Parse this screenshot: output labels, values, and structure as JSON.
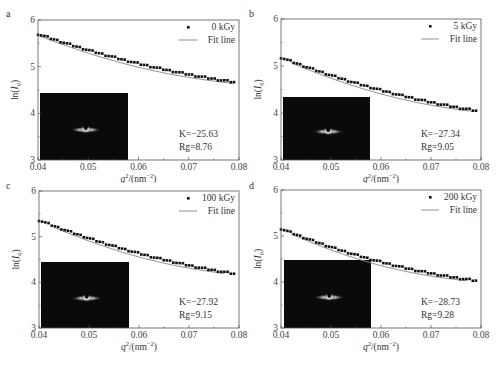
{
  "chart_data": [
    {
      "type": "scatter",
      "panel_label": "a",
      "title": "",
      "xlabel": "q²/(nm⁻²)",
      "ylabel": "ln(I_q)",
      "xlim": [
        0.04,
        0.08
      ],
      "ylim": [
        3,
        6
      ],
      "xticks": [
        "0.04",
        "0.05",
        "0.06",
        "0.07",
        "0.08"
      ],
      "yticks": [
        "3",
        "4",
        "5",
        "6"
      ],
      "grid": false,
      "legend": {
        "position": "upper right",
        "entries": [
          "0 kGy",
          "Fit line"
        ]
      },
      "series": [
        {
          "name": "0 kGy",
          "kind": "scatter",
          "x_start": 0.04,
          "x_end": 0.079,
          "y_start": 5.7,
          "y_mid": 5.08,
          "y_end": 4.67
        },
        {
          "name": "Fit line",
          "kind": "line",
          "x_start": 0.04,
          "x_end": 0.079,
          "y_start": 5.7,
          "y_end": 4.67
        }
      ],
      "annotations": [
        "K=−25.63",
        "Rg=8.76"
      ],
      "inset": "SAXS 2D scattering pattern"
    },
    {
      "type": "scatter",
      "panel_label": "b",
      "title": "",
      "xlabel": "q²/(nm⁻²)",
      "ylabel": "ln(I_q)",
      "xlim": [
        0.04,
        0.08
      ],
      "ylim": [
        3,
        6
      ],
      "xticks": [
        "0.04",
        "0.05",
        "0.06",
        "0.07",
        "0.08"
      ],
      "yticks": [
        "3",
        "4",
        "5",
        "6"
      ],
      "grid": false,
      "legend": {
        "position": "upper right",
        "entries": [
          "5 kGy",
          "Fit line"
        ]
      },
      "series": [
        {
          "name": "5 kGy",
          "kind": "scatter",
          "x_start": 0.04,
          "x_end": 0.079,
          "y_start": 5.18,
          "y_mid": 4.5,
          "y_end": 4.05
        },
        {
          "name": "Fit line",
          "kind": "line",
          "x_start": 0.042,
          "x_end": 0.078,
          "y_start": 5.02,
          "y_end": 4.0
        }
      ],
      "annotations": [
        "K=−27.34",
        "Rg=9.05"
      ],
      "inset": "SAXS 2D scattering pattern"
    },
    {
      "type": "scatter",
      "panel_label": "c",
      "title": "",
      "xlabel": "q²/(nm⁻²)",
      "ylabel": "ln(I_q)",
      "xlim": [
        0.04,
        0.08
      ],
      "ylim": [
        3,
        6
      ],
      "xticks": [
        "0.04",
        "0.05",
        "0.06",
        "0.07",
        "0.08"
      ],
      "yticks": [
        "3",
        "4",
        "5",
        "6"
      ],
      "grid": false,
      "legend": {
        "position": "upper right",
        "entries": [
          "100 kGy",
          "Fit line"
        ]
      },
      "series": [
        {
          "name": "100 kGy",
          "kind": "scatter",
          "x_start": 0.04,
          "x_end": 0.079,
          "y_start": 5.36,
          "y_mid": 4.65,
          "y_end": 4.19
        },
        {
          "name": "Fit line",
          "kind": "line",
          "x_start": 0.043,
          "x_end": 0.077,
          "y_start": 5.15,
          "y_end": 4.21
        }
      ],
      "annotations": [
        "K=−27.92",
        "Rg=9.15"
      ],
      "inset": "SAXS 2D scattering pattern"
    },
    {
      "type": "scatter",
      "panel_label": "d",
      "title": "",
      "xlabel": "q²/(nm⁻²)",
      "ylabel": "ln(I_q)",
      "xlim": [
        0.04,
        0.08
      ],
      "ylim": [
        3,
        6
      ],
      "xticks": [
        "0.04",
        "0.05",
        "0.06",
        "0.07",
        "0.08"
      ],
      "yticks": [
        "3",
        "4",
        "5",
        "6"
      ],
      "grid": false,
      "legend": {
        "position": "upper right",
        "entries": [
          "200 kGy",
          "Fit line"
        ]
      },
      "series": [
        {
          "name": "200 kGy",
          "kind": "scatter",
          "x_start": 0.04,
          "x_end": 0.079,
          "y_start": 5.16,
          "y_mid": 4.45,
          "y_end": 4.03
        },
        {
          "name": "Fit line",
          "kind": "line",
          "x_start": 0.042,
          "x_end": 0.077,
          "y_start": 5.05,
          "y_end": 4.02
        }
      ],
      "annotations": [
        "K=−28.73",
        "Rg=9.28"
      ],
      "inset": "SAXS 2D scattering pattern"
    }
  ],
  "panels": [
    {
      "label": "a",
      "legend_series": "0 kGy",
      "legend_fit": "Fit line",
      "k_text": "K=−25.63",
      "rg_text": "Rg=8.76"
    },
    {
      "label": "b",
      "legend_series": "5 kGy",
      "legend_fit": "Fit line",
      "k_text": "K=−27.34",
      "rg_text": "Rg=9.05"
    },
    {
      "label": "c",
      "legend_series": "100 kGy",
      "legend_fit": "Fit line",
      "k_text": "K=−27.92",
      "rg_text": "Rg=9.15"
    },
    {
      "label": "d",
      "legend_series": "200 kGy",
      "legend_fit": "Fit line",
      "k_text": "K=−28.73",
      "rg_text": "Rg=9.28"
    }
  ],
  "axes": {
    "xticks": [
      "0.04",
      "0.05",
      "0.06",
      "0.07",
      "0.08"
    ],
    "yticks": [
      "3",
      "4",
      "5",
      "6"
    ],
    "xlabel_main": "q",
    "xlabel_sup": "2",
    "xlabel_rest": "/(nm",
    "xlabel_exp": "−2",
    "xlabel_close": ")",
    "ylabel_main": "ln(",
    "ylabel_I": "I",
    "ylabel_sub": "q",
    "ylabel_close": ")"
  }
}
